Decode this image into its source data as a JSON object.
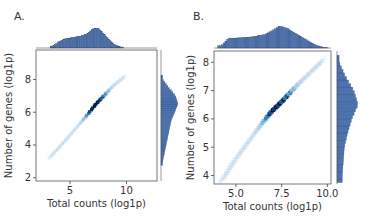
{
  "figure": {
    "panels": [
      {
        "label": "A."
      },
      {
        "label": "B."
      }
    ]
  },
  "chart_data": [
    {
      "type": "heatmap",
      "subtype": "jointplot-hexbin-with-marginal-histograms",
      "panel_label": "A.",
      "xlabel": "Total counts (log1p)",
      "ylabel": "Number of genes (log1p)",
      "xlim": [
        2,
        12.7
      ],
      "ylim": [
        1.8,
        9.8
      ],
      "xticks": [
        5,
        10
      ],
      "xtick_labels": [
        "5",
        "10"
      ],
      "yticks": [
        2,
        4,
        6,
        8
      ],
      "ytick_labels": [
        "2",
        "4",
        "6",
        "8"
      ],
      "grid": false,
      "colormap": "Blues",
      "density_ridge": {
        "x": [
          3.3,
          4.5,
          5.5,
          6.5,
          7.3,
          8.0,
          8.8,
          9.7
        ],
        "y": [
          3.3,
          4.2,
          5.0,
          5.8,
          6.5,
          7.0,
          7.6,
          8.1
        ]
      },
      "density_peak": {
        "x": 7.3,
        "y": 6.5
      },
      "marginal_x_hist": {
        "bins_center": [
          3.5,
          4.0,
          4.5,
          5.0,
          5.5,
          6.0,
          6.5,
          7.0,
          7.5,
          8.0,
          8.5,
          9.0,
          9.5
        ],
        "relative_heights": [
          0.1,
          0.3,
          0.45,
          0.5,
          0.55,
          0.6,
          0.7,
          0.95,
          1.0,
          0.7,
          0.4,
          0.15,
          0.05
        ]
      },
      "marginal_y_hist": {
        "bins_center": [
          3.0,
          3.5,
          4.0,
          4.5,
          5.0,
          5.5,
          6.0,
          6.5,
          7.0,
          7.5,
          8.0
        ],
        "relative_heights": [
          0.1,
          0.2,
          0.3,
          0.4,
          0.5,
          0.6,
          0.8,
          1.0,
          0.85,
          0.45,
          0.1
        ]
      },
      "color": "#4c72b0"
    },
    {
      "type": "heatmap",
      "subtype": "jointplot-hexbin-with-marginal-histograms",
      "panel_label": "B.",
      "xlabel": "Total counts (log1p)",
      "ylabel": "Number of genes (log1p)",
      "xlim": [
        3.8,
        10.2
      ],
      "ylim": [
        3.7,
        8.4
      ],
      "xticks": [
        5.0,
        7.5,
        10.0
      ],
      "xtick_labels": [
        "5.0",
        "7.5",
        "10.0"
      ],
      "yticks": [
        4,
        5,
        6,
        7,
        8
      ],
      "ytick_labels": [
        "4",
        "5",
        "6",
        "7",
        "8"
      ],
      "grid": false,
      "colormap": "Blues",
      "density_ridge": {
        "x": [
          4.3,
          5.0,
          5.8,
          6.5,
          7.0,
          7.5,
          8.2,
          9.0,
          9.8
        ],
        "y": [
          3.9,
          4.6,
          5.3,
          5.9,
          6.3,
          6.6,
          7.1,
          7.6,
          8.1
        ]
      },
      "density_peak": {
        "x": 7.3,
        "y": 6.5
      },
      "marginal_x_hist": {
        "bins_center": [
          4.2,
          4.6,
          5.0,
          5.4,
          5.8,
          6.2,
          6.6,
          7.0,
          7.4,
          7.8,
          8.2,
          8.6,
          9.0,
          9.4,
          9.8
        ],
        "relative_heights": [
          0.1,
          0.45,
          0.45,
          0.48,
          0.5,
          0.55,
          0.62,
          0.8,
          1.0,
          0.9,
          0.7,
          0.5,
          0.3,
          0.12,
          0.03
        ]
      },
      "marginal_y_hist": {
        "bins_center": [
          4.0,
          4.5,
          5.0,
          5.5,
          6.0,
          6.5,
          7.0,
          7.5,
          8.0
        ],
        "relative_heights": [
          0.25,
          0.3,
          0.35,
          0.5,
          0.7,
          1.0,
          0.8,
          0.4,
          0.1
        ]
      },
      "color": "#4c72b0"
    }
  ]
}
